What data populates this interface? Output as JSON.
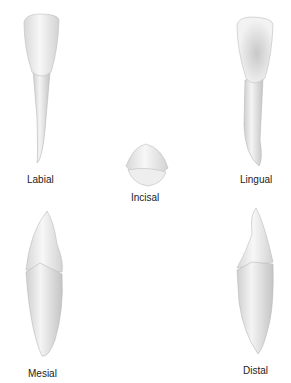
{
  "views": [
    {
      "id": "labial",
      "label": "Labial"
    },
    {
      "id": "lingual",
      "label": "Lingual"
    },
    {
      "id": "incisal",
      "label": "Incisal"
    },
    {
      "id": "mesial",
      "label": "Mesial"
    },
    {
      "id": "distal",
      "label": "Distal"
    }
  ]
}
